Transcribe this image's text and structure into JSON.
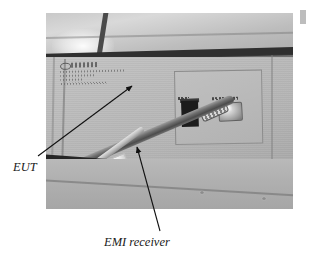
{
  "figure": {
    "type": "photograph",
    "colors": {
      "panel_gray": "#b8b8b8",
      "frame_dark": "#2a2a2a",
      "annotation_text": "#1a1a1a",
      "page_background": "#ffffff"
    }
  },
  "annotations": [
    {
      "id": "eut",
      "label": "EUT",
      "style": "italic-serif",
      "points_to": "equipment under test enclosure panel",
      "arrow": {
        "from_x": 38,
        "from_y": 156,
        "to_x": 133,
        "to_y": 85
      }
    },
    {
      "id": "emi",
      "label": "EMI receiver",
      "style": "italic-serif",
      "points_to": "coaxial cable running to the EMI receiver",
      "arrow": {
        "from_x": 160,
        "from_y": 231,
        "to_x": 137,
        "to_y": 146
      }
    }
  ],
  "photo_elements": {
    "cable_tag_text": "nsi",
    "placard": {
      "logo_text": "",
      "body_lines": [
        "",
        "",
        "",
        ""
      ]
    },
    "port_captions": [
      "",
      ""
    ]
  }
}
